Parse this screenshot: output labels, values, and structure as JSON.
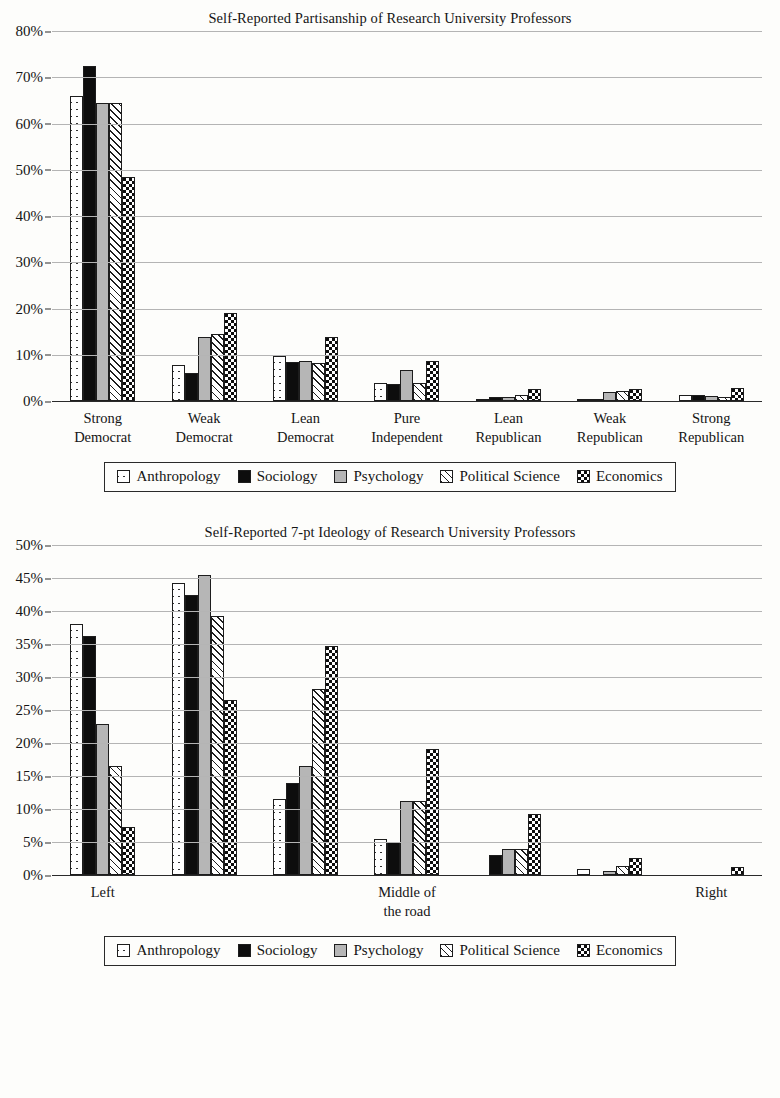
{
  "charts": [
    {
      "title": "Self-Reported Partisanship of Research University Professors",
      "yticks": [
        "0%",
        "10%",
        "20%",
        "30%",
        "40%",
        "50%",
        "60%",
        "70%",
        "80%"
      ],
      "categories": [
        {
          "line1": "Strong",
          "line2": "Democrat"
        },
        {
          "line1": "Weak",
          "line2": "Democrat"
        },
        {
          "line1": "Lean",
          "line2": "Democrat"
        },
        {
          "line1": "Pure",
          "line2": "Independent"
        },
        {
          "line1": "Lean",
          "line2": "Republican"
        },
        {
          "line1": "Weak",
          "line2": "Republican"
        },
        {
          "line1": "Strong",
          "line2": "Republican"
        }
      ],
      "legend": [
        {
          "label": "Anthropology",
          "pattern": "dotted-white"
        },
        {
          "label": "Sociology",
          "pattern": "solid-black"
        },
        {
          "label": "Psychology",
          "pattern": "solid-gray"
        },
        {
          "label": "Political Science",
          "pattern": "diagonal-hatch"
        },
        {
          "label": "Economics",
          "pattern": "checkerboard"
        }
      ]
    },
    {
      "title": "Self-Reported 7-pt Ideology of Research University Professors",
      "yticks": [
        "0%",
        "5%",
        "10%",
        "15%",
        "20%",
        "25%",
        "30%",
        "35%",
        "40%",
        "45%",
        "50%"
      ],
      "categories": [
        {
          "line1": "Left",
          "line2": ""
        },
        {
          "line1": "",
          "line2": ""
        },
        {
          "line1": "",
          "line2": ""
        },
        {
          "line1": "Middle of",
          "line2": "the road"
        },
        {
          "line1": "",
          "line2": ""
        },
        {
          "line1": "",
          "line2": ""
        },
        {
          "line1": "Right",
          "line2": ""
        }
      ],
      "legend": [
        {
          "label": "Anthropology",
          "pattern": "dotted-white"
        },
        {
          "label": "Sociology",
          "pattern": "solid-black"
        },
        {
          "label": "Psychology",
          "pattern": "solid-gray"
        },
        {
          "label": "Political Science",
          "pattern": "diagonal-hatch"
        },
        {
          "label": "Economics",
          "pattern": "checkerboard"
        }
      ]
    }
  ],
  "chart_data": [
    {
      "type": "bar",
      "title": "Self-Reported Partisanship of Research University Professors",
      "xlabel": "",
      "ylabel": "",
      "ylim": [
        0,
        80
      ],
      "ytick_step": 10,
      "ytick_format": "percent",
      "grid": true,
      "legend_position": "bottom",
      "categories": [
        "Strong Democrat",
        "Weak Democrat",
        "Lean Democrat",
        "Pure Independent",
        "Lean Republican",
        "Weak Republican",
        "Strong Republican"
      ],
      "series": [
        {
          "name": "Anthropology",
          "values": [
            65.9,
            7.8,
            9.8,
            4.0,
            0.4,
            0.3,
            1.2
          ]
        },
        {
          "name": "Sociology",
          "values": [
            72.5,
            6.0,
            8.5,
            3.6,
            0.8,
            0.2,
            1.3
          ]
        },
        {
          "name": "Psychology",
          "values": [
            64.4,
            13.8,
            8.7,
            6.6,
            0.9,
            1.9,
            1.1
          ]
        },
        {
          "name": "Political Science",
          "values": [
            64.4,
            14.5,
            8.3,
            3.8,
            1.2,
            2.1,
            0.8
          ]
        },
        {
          "name": "Economics",
          "values": [
            48.4,
            19.1,
            13.8,
            8.6,
            2.7,
            2.6,
            2.8
          ]
        }
      ]
    },
    {
      "type": "bar",
      "title": "Self-Reported 7-pt Ideology of Research University Professors",
      "xlabel": "",
      "ylabel": "",
      "ylim": [
        0,
        50
      ],
      "ytick_step": 5,
      "ytick_format": "percent",
      "grid": true,
      "legend_position": "bottom",
      "categories": [
        "Left",
        "2",
        "3",
        "Middle of the road",
        "5",
        "6",
        "Right"
      ],
      "series": [
        {
          "name": "Anthropology",
          "values": [
            38.0,
            44.3,
            11.6,
            5.5,
            0.0,
            1.0,
            0.0
          ]
        },
        {
          "name": "Sociology",
          "values": [
            36.3,
            42.5,
            13.9,
            5.0,
            3.0,
            0.0,
            0.0
          ]
        },
        {
          "name": "Psychology",
          "values": [
            22.9,
            45.4,
            16.6,
            11.3,
            4.0,
            0.6,
            0.0
          ]
        },
        {
          "name": "Political Science",
          "values": [
            16.5,
            39.3,
            28.2,
            11.3,
            4.0,
            1.4,
            0.0
          ]
        },
        {
          "name": "Economics",
          "values": [
            7.3,
            26.5,
            34.7,
            19.1,
            9.3,
            2.6,
            1.3
          ]
        }
      ]
    }
  ]
}
